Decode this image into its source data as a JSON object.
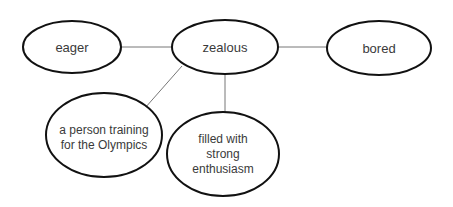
{
  "diagram": {
    "type": "word-map",
    "center": {
      "label": "zealous"
    },
    "nodes": {
      "synonym": {
        "label": "eager"
      },
      "center": {
        "label": "zealous"
      },
      "antonym": {
        "label": "bored"
      },
      "example": {
        "lines": [
          "a person training",
          "for the Olympics"
        ]
      },
      "definition": {
        "lines": [
          "filled with",
          "strong",
          "enthusiasm"
        ]
      }
    },
    "edges": [
      {
        "from": "eager",
        "to": "zealous"
      },
      {
        "from": "zealous",
        "to": "bored"
      },
      {
        "from": "zealous",
        "to": "a person training for the Olympics"
      },
      {
        "from": "zealous",
        "to": "filled with strong enthusiasm"
      }
    ],
    "colors": {
      "ellipse_stroke": "#111111",
      "edge": "#777777",
      "text": "#3a3a3a",
      "background": "#ffffff"
    }
  }
}
